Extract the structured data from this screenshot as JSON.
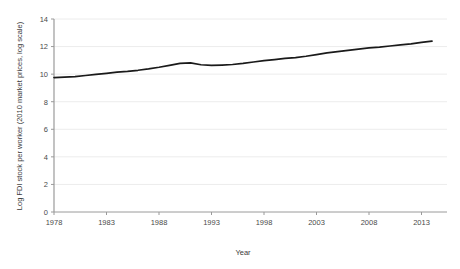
{
  "chart_data": {
    "type": "line",
    "title": "",
    "xlabel": "Year",
    "ylabel": "Log FDI stock per worker (2010 market prices, log scale)",
    "xlim": [
      1978,
      2014
    ],
    "ylim": [
      0,
      14
    ],
    "xticks": [
      1978,
      1983,
      1988,
      1993,
      1998,
      2003,
      2008,
      2013
    ],
    "yticks": [
      0,
      2,
      4,
      6,
      8,
      10,
      12,
      14
    ],
    "grid": "horizontal",
    "legend": "none",
    "line_color": "#1a1a1a",
    "series": [
      {
        "name": "Log FDI stock per worker",
        "x": [
          1978,
          1979,
          1980,
          1981,
          1982,
          1983,
          1984,
          1985,
          1986,
          1987,
          1988,
          1989,
          1990,
          1991,
          1992,
          1993,
          1994,
          1995,
          1996,
          1997,
          1998,
          1999,
          2000,
          2001,
          2002,
          2003,
          2004,
          2005,
          2006,
          2007,
          2008,
          2009,
          2010,
          2011,
          2012,
          2013,
          2014
        ],
        "values": [
          9.75,
          9.78,
          9.82,
          9.9,
          9.98,
          10.06,
          10.14,
          10.2,
          10.28,
          10.38,
          10.5,
          10.64,
          10.78,
          10.82,
          10.68,
          10.63,
          10.66,
          10.7,
          10.78,
          10.88,
          10.98,
          11.06,
          11.14,
          11.2,
          11.3,
          11.42,
          11.54,
          11.63,
          11.72,
          11.82,
          11.9,
          11.96,
          12.04,
          12.12,
          12.2,
          12.3,
          12.4
        ]
      }
    ]
  },
  "axes": {
    "x_tick_labels": [
      "1978",
      "1983",
      "1988",
      "1993",
      "1998",
      "2003",
      "2008",
      "2013"
    ],
    "y_tick_labels": [
      "0",
      "2",
      "4",
      "6",
      "8",
      "10",
      "12",
      "14"
    ],
    "x_axis_title": "Year",
    "y_axis_title": "Log FDI stock per worker (2010 market prices, log scale)"
  }
}
